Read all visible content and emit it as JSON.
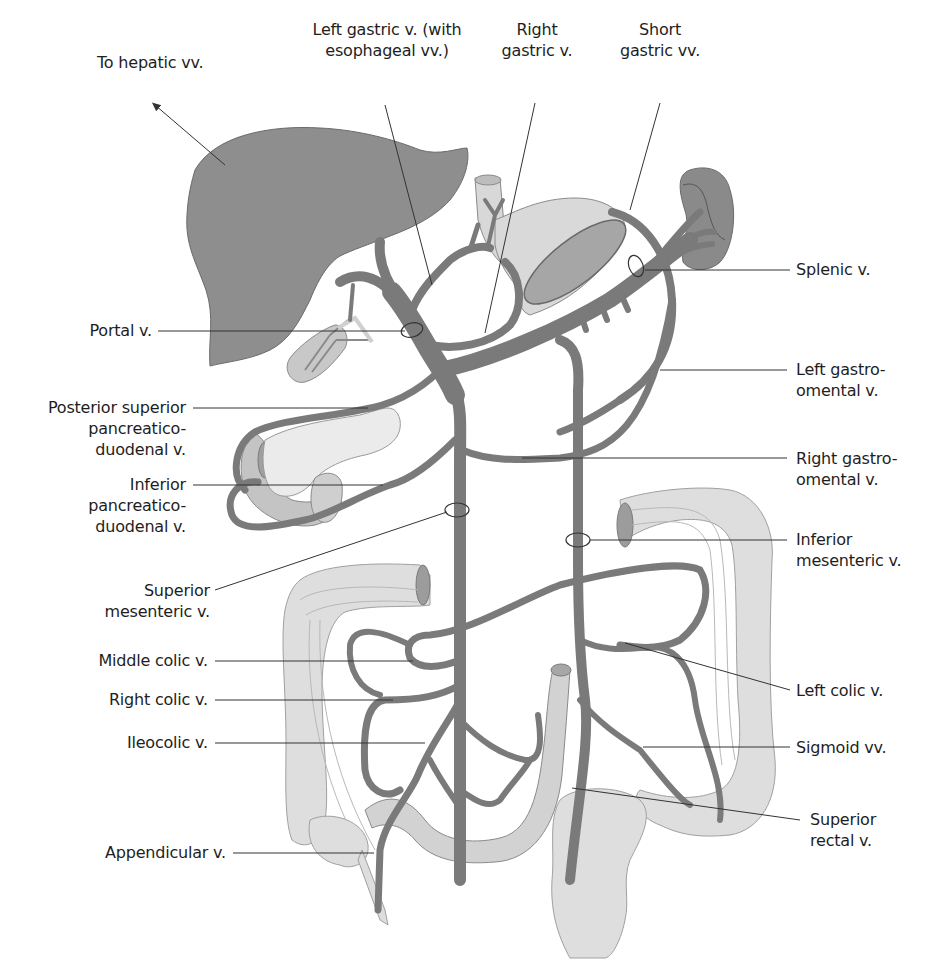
{
  "figure": {
    "colors": {
      "vein": "#7a7a7a",
      "vein_outline": "#5c5c5c",
      "liver": "#8e8e8e",
      "spleen": "#8a8a8a",
      "organ_light": "#dcdcdc",
      "organ_outline": "#9a9a9a",
      "leader_line": "#333333",
      "text": "#1e1e1e",
      "background": "#ffffff"
    }
  },
  "labels": {
    "to_hepatic": {
      "lines": [
        "To hepatic vv."
      ]
    },
    "left_gastric": {
      "lines": [
        "Left gastric v. (with",
        "esophageal vv.)"
      ]
    },
    "right_gastric": {
      "lines": [
        "Right",
        "gastric v."
      ]
    },
    "short_gastric": {
      "lines": [
        "Short",
        "gastric vv."
      ]
    },
    "splenic": {
      "lines": [
        "Splenic v."
      ]
    },
    "portal": {
      "lines": [
        "Portal v."
      ]
    },
    "left_gastroomental": {
      "lines": [
        "Left gastro-",
        "omental v."
      ]
    },
    "post_sup_pd": {
      "lines": [
        "Posterior superior",
        "pancreatico-",
        "duodenal v."
      ]
    },
    "right_gastroomental": {
      "lines": [
        "Right gastro-",
        "omental v."
      ]
    },
    "inf_pd": {
      "lines": [
        "Inferior",
        "pancreatico-",
        "duodenal v."
      ]
    },
    "inf_mesenteric": {
      "lines": [
        "Inferior",
        "mesenteric v."
      ]
    },
    "sup_mesenteric": {
      "lines": [
        "Superior",
        "mesenteric v."
      ]
    },
    "middle_colic": {
      "lines": [
        "Middle colic v."
      ]
    },
    "left_colic": {
      "lines": [
        "Left colic v."
      ]
    },
    "right_colic": {
      "lines": [
        "Right colic v."
      ]
    },
    "ileocolic": {
      "lines": [
        "Ileocolic v."
      ]
    },
    "sigmoid": {
      "lines": [
        "Sigmoid vv."
      ]
    },
    "sup_rectal": {
      "lines": [
        "Superior",
        "rectal v."
      ]
    },
    "appendicular": {
      "lines": [
        "Appendicular v."
      ]
    }
  }
}
